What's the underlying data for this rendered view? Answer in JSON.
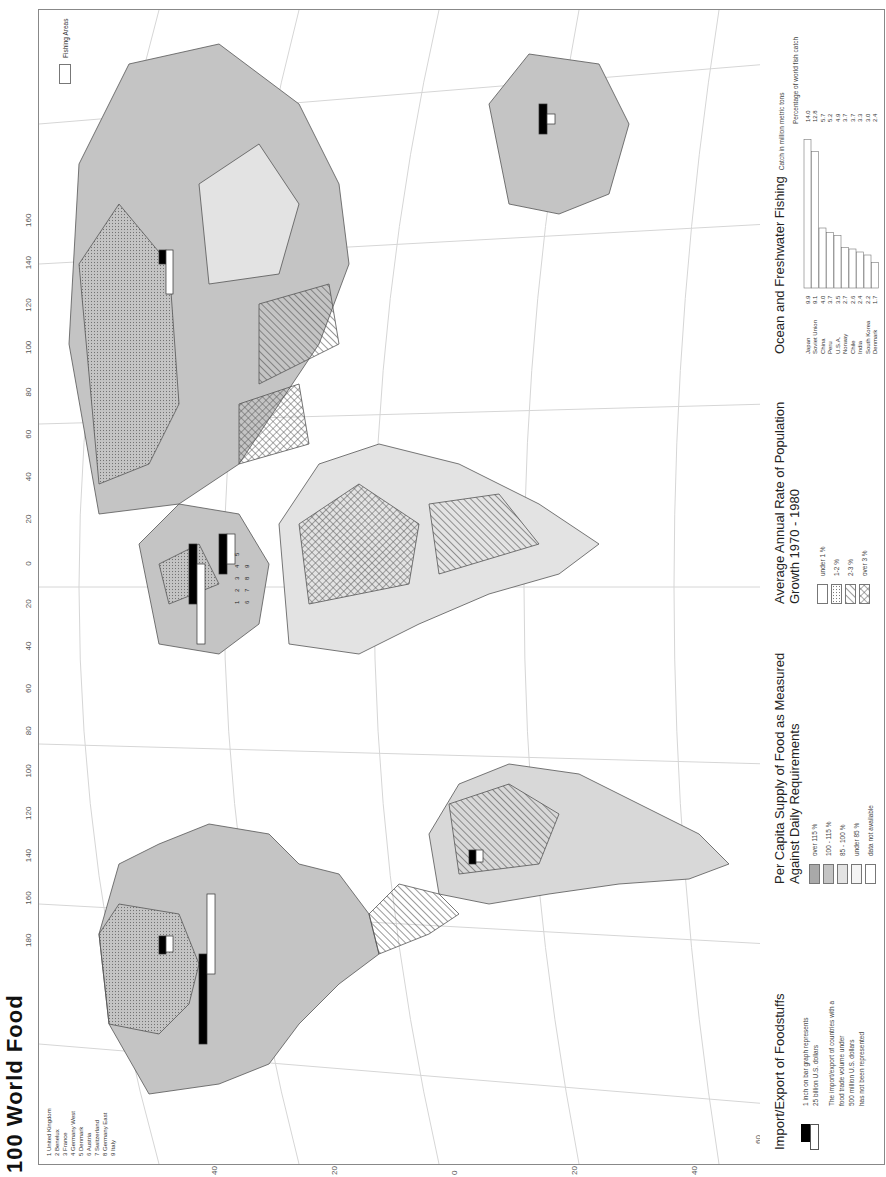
{
  "page": {
    "title": "100  World Food",
    "orientation": "rotated 90 degrees counter-clockwise"
  },
  "map": {
    "longitude_labels_top": [
      "180",
      "160",
      "140",
      "120",
      "100",
      "80",
      "60",
      "40",
      "20",
      "0",
      "20",
      "40",
      "60",
      "80",
      "100",
      "120",
      "140",
      "160"
    ],
    "latitude_labels_left": [
      "40",
      "20",
      "0",
      "20",
      "40"
    ],
    "latitude_labels_right": [
      "40",
      "20",
      "0",
      "20",
      "40"
    ],
    "parallel_labels": [
      "60",
      "80",
      "60",
      "80",
      "60"
    ],
    "fishing_areas_label": "Fishing Areas",
    "europe_key": {
      "items": [
        "1 United Kingdom",
        "2 Benelux",
        "3 France",
        "4 Germany West",
        "5 Denmark",
        "6 Austria",
        "7 Switzerland",
        "8 Germany East",
        "9 Italy"
      ]
    },
    "europe_bar_numbers": [
      "1",
      "2",
      "3",
      "4",
      "5",
      "6",
      "7",
      "8",
      "9"
    ],
    "colors": {
      "land_high": "#a9a9a9",
      "land_mid": "#c4c4c4",
      "land_low": "#e3e3e3",
      "water_tint": "#eeeeee",
      "export_bar": "#000000",
      "import_bar": "#ffffff",
      "border": "#444444"
    }
  },
  "legends": {
    "import_export": {
      "title": "Import/Export of Foodstuffs",
      "scale_note_1": "1 inch on bar graph represents",
      "scale_note_2": "25 billion U.S. dollars",
      "threshold_note_1": "The import/export of countries with a",
      "threshold_note_2": "food trade volume under",
      "threshold_note_3": "500 million U.S. dollars",
      "threshold_note_4": "has not been represented"
    },
    "food_supply": {
      "title_1": "Per Capita Supply of Food as Measured",
      "title_2": "Against Daily Requirements",
      "classes": [
        {
          "label": "over 115 %",
          "color": "#a9a9a9"
        },
        {
          "label": "100 - 115 %",
          "color": "#c4c4c4"
        },
        {
          "label": "85 - 100 %",
          "color": "#e3e3e3"
        },
        {
          "label": "under 85 %",
          "color": "#f4f4f4"
        },
        {
          "label": "data not available",
          "color": "#ffffff"
        }
      ]
    },
    "population_growth": {
      "title_1": "Average Annual Rate of Population",
      "title_2": "Growth 1970 - 1980",
      "classes": [
        {
          "label": "under 1 %",
          "pattern": "none"
        },
        {
          "label": "1-2 %",
          "pattern": "dots"
        },
        {
          "label": "2-3 %",
          "pattern": "diagonal"
        },
        {
          "label": "over 3 %",
          "pattern": "crosshatch"
        }
      ]
    },
    "fishing": {
      "title": "Ocean and Freshwater Fishing",
      "catch_header": "Catch in million metric tons",
      "percent_header": "Percentage of world fish catch"
    }
  },
  "chart_data": {
    "type": "bar",
    "title": "Ocean and Freshwater Fishing",
    "xlabel": "",
    "ylabel": "Catch in million metric tons",
    "categories": [
      "Japan",
      "Soviet Union",
      "China",
      "Peru",
      "U.S.A.",
      "Norway",
      "Chile",
      "India",
      "South Korea",
      "Denmark"
    ],
    "series": [
      {
        "name": "Catch in million metric tons",
        "values": [
          9.9,
          9.1,
          4.0,
          3.7,
          3.5,
          2.7,
          2.6,
          2.4,
          2.2,
          1.7
        ]
      },
      {
        "name": "Percentage of world fish catch",
        "values": [
          14.0,
          12.8,
          5.7,
          5.2,
          4.9,
          3.7,
          3.7,
          3.3,
          3.0,
          2.4
        ]
      }
    ],
    "ylim": [
      0,
      10
    ]
  }
}
